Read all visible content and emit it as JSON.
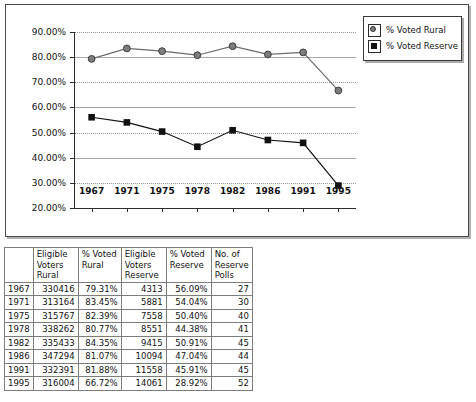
{
  "chart_data": {
    "type": "line",
    "title": "",
    "xlabel": "",
    "ylabel": "",
    "categories": [
      "1967",
      "1971",
      "1975",
      "1978",
      "1982",
      "1986",
      "1991",
      "1995"
    ],
    "ylim": [
      20,
      90
    ],
    "ytick_labels": [
      "20.00%",
      "30.00%",
      "40.00%",
      "50.00%",
      "60.00%",
      "70.00%",
      "80.00%",
      "90.00%"
    ],
    "ytick_values": [
      20,
      30,
      40,
      50,
      60,
      70,
      80,
      90
    ],
    "grid": "horizontal",
    "legend_position": "top-right",
    "series": [
      {
        "name": "% Voted Rural",
        "marker": "circle",
        "color": "#7d7d7d",
        "line_color": "#6b6b6b",
        "values": [
          79.31,
          83.45,
          82.39,
          80.77,
          84.35,
          81.07,
          81.88,
          66.72
        ]
      },
      {
        "name": "% Voted Reserve",
        "marker": "square",
        "color": "#111111",
        "line_color": "#111111",
        "values": [
          56.09,
          54.04,
          50.4,
          44.38,
          50.91,
          47.04,
          45.91,
          28.92
        ]
      }
    ]
  },
  "legend": {
    "items": [
      {
        "label": "% Voted Rural",
        "marker": "circle"
      },
      {
        "label": "% Voted Reserve",
        "marker": "square"
      }
    ]
  },
  "table": {
    "headers": [
      "",
      "Eligible Voters Rural",
      "% Voted Rural",
      "Eligible Voters Reserve",
      "% Voted Reserve",
      "No. of Reserve Polls"
    ],
    "rows": [
      {
        "year": "1967",
        "eligible_rural": "330416",
        "pct_rural": "79.31%",
        "eligible_reserve": "4313",
        "pct_reserve": "56.09%",
        "reserve_polls": "27"
      },
      {
        "year": "1971",
        "eligible_rural": "313164",
        "pct_rural": "83.45%",
        "eligible_reserve": "5881",
        "pct_reserve": "54.04%",
        "reserve_polls": "30"
      },
      {
        "year": "1975",
        "eligible_rural": "315767",
        "pct_rural": "82.39%",
        "eligible_reserve": "7558",
        "pct_reserve": "50.40%",
        "reserve_polls": "40"
      },
      {
        "year": "1978",
        "eligible_rural": "338262",
        "pct_rural": "80.77%",
        "eligible_reserve": "8551",
        "pct_reserve": "44.38%",
        "reserve_polls": "41"
      },
      {
        "year": "1982",
        "eligible_rural": "335433",
        "pct_rural": "84.35%",
        "eligible_reserve": "9415",
        "pct_reserve": "50.91%",
        "reserve_polls": "45"
      },
      {
        "year": "1986",
        "eligible_rural": "347294",
        "pct_rural": "81.07%",
        "eligible_reserve": "10094",
        "pct_reserve": "47.04%",
        "reserve_polls": "44"
      },
      {
        "year": "1991",
        "eligible_rural": "332391",
        "pct_rural": "81.88%",
        "eligible_reserve": "11558",
        "pct_reserve": "45.91%",
        "reserve_polls": "45"
      },
      {
        "year": "1995",
        "eligible_rural": "316004",
        "pct_rural": "66.72%",
        "eligible_reserve": "14061",
        "pct_reserve": "28.92%",
        "reserve_polls": "52"
      }
    ]
  }
}
